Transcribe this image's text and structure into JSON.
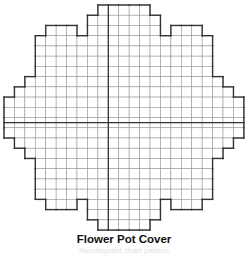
{
  "title": "Flower Pot Cover",
  "subtitle": "Needlepoint chart pattern",
  "grid": {
    "origin_x": 4,
    "origin_y": 5,
    "cell_w": 10.43,
    "cell_h": 10.23,
    "columns": 23,
    "rows": 22,
    "center_col": 10,
    "center_row": 11.5,
    "line_color": "#9a9a9a",
    "outline_color": "#333333",
    "center_line_color": "#333333",
    "row_spans": [
      [
        [
          9,
          14
        ]
      ],
      [
        [
          8,
          15
        ]
      ],
      [
        [
          4,
          7
        ],
        [
          8,
          15
        ],
        [
          16,
          19
        ]
      ],
      [
        [
          3,
          20
        ]
      ],
      [
        [
          3,
          20
        ]
      ],
      [
        [
          3,
          20
        ]
      ],
      [
        [
          3,
          20
        ]
      ],
      [
        [
          2,
          21
        ]
      ],
      [
        [
          1,
          22
        ]
      ],
      [
        [
          0,
          23
        ]
      ],
      [
        [
          0,
          23
        ]
      ],
      [
        [
          0,
          23
        ]
      ],
      [
        [
          0,
          23
        ]
      ],
      [
        [
          1,
          22
        ]
      ],
      [
        [
          2,
          21
        ]
      ],
      [
        [
          3,
          20
        ]
      ],
      [
        [
          3,
          20
        ]
      ],
      [
        [
          3,
          20
        ]
      ],
      [
        [
          3,
          20
        ]
      ],
      [
        [
          4,
          7
        ],
        [
          8,
          15
        ],
        [
          16,
          19
        ]
      ],
      [
        [
          8,
          15
        ]
      ],
      [
        [
          9,
          14
        ]
      ]
    ]
  }
}
